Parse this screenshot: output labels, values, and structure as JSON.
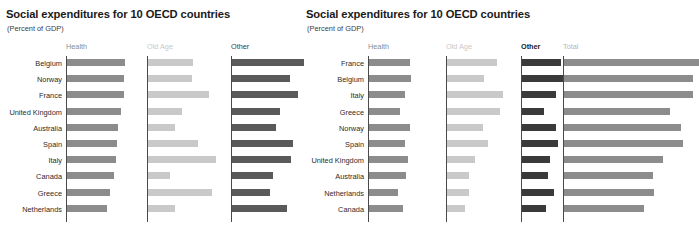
{
  "chart_data": [
    {
      "id": "left",
      "type": "bar",
      "title": "Social expenditures for 10 OECD countries",
      "subtitle": "(Percent of GDP)",
      "xlabel": "",
      "ylabel": "",
      "grid": false,
      "legend": "column-headers",
      "sorted_by": "Health",
      "categories": [
        "Belgium",
        "Norway",
        "France",
        "United Kingdom",
        "Australia",
        "Spain",
        "Italy",
        "Canada",
        "Greece",
        "Netherlands"
      ],
      "series": [
        {
          "name": "Health",
          "color": "#8c8c8c",
          "header_color": "#8c8c8c",
          "header_bold": false,
          "values": [
            8.0,
            7.9,
            7.8,
            7.5,
            7.0,
            6.9,
            6.8,
            6.5,
            5.9,
            5.5
          ]
        },
        {
          "name": "Old Age",
          "color": "#c9c9c9",
          "header_color": "#c9c9c9",
          "header_bold": false,
          "values": [
            6.6,
            6.5,
            9.0,
            5.0,
            3.9,
            7.4,
            10.0,
            3.2,
            9.4,
            4.0
          ]
        },
        {
          "name": "Other",
          "color": "#5a5a5a",
          "header_color": "#3d3d3d",
          "header_bold": false,
          "values": [
            11.2,
            9.0,
            10.3,
            7.4,
            6.9,
            9.5,
            9.1,
            6.4,
            5.9,
            8.6
          ]
        }
      ]
    },
    {
      "id": "right",
      "type": "bar",
      "title": "Social expenditures for 10 OECD countries",
      "subtitle": "(Percent of GDP)",
      "xlabel": "",
      "ylabel": "",
      "grid": false,
      "legend": "column-headers",
      "sorted_by": "Total",
      "categories": [
        "France",
        "Belgium",
        "Italy",
        "Greece",
        "Norway",
        "Spain",
        "United Kingdom",
        "Australia",
        "Netherlands",
        "Canada"
      ],
      "series": [
        {
          "name": "Health",
          "color": "#8c8c8c",
          "header_color": "#8c8c8c",
          "header_bold": false,
          "values": [
            7.8,
            8.0,
            6.8,
            5.9,
            7.9,
            6.9,
            7.5,
            7.0,
            5.5,
            6.5
          ]
        },
        {
          "name": "Old Age",
          "color": "#c9c9c9",
          "header_color": "#c9c9c9",
          "header_bold": false,
          "values": [
            9.0,
            6.6,
            10.0,
            9.4,
            6.5,
            7.4,
            5.0,
            3.9,
            4.0,
            3.2
          ]
        },
        {
          "name": "Other",
          "color": "#3a3a3a",
          "header_color": "#1a1a1a",
          "header_bold": true,
          "values": [
            10.3,
            11.2,
            9.1,
            5.9,
            9.0,
            9.5,
            7.4,
            6.9,
            8.6,
            6.4
          ]
        },
        {
          "name": "Total",
          "color": "#8c8c8c",
          "header_color": "#b5b5b5",
          "header_bold": false,
          "values": [
            27.1,
            25.8,
            25.9,
            21.2,
            23.4,
            23.8,
            19.9,
            17.8,
            18.1,
            16.1
          ]
        }
      ]
    }
  ]
}
